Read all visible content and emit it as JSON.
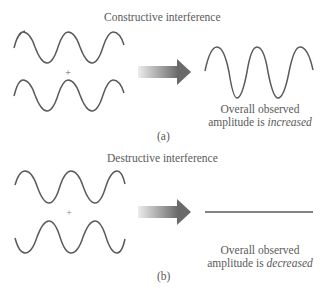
{
  "panels": [
    {
      "id": "a",
      "title": "Constructive interference",
      "plus": "+",
      "result_line1": "Overall observed",
      "result_line2_prefix": "amplitude is ",
      "result_line2_emph": "increased",
      "caption": "(a)"
    },
    {
      "id": "b",
      "title": "Destructive interference",
      "plus": "+",
      "result_line1": "Overall observed",
      "result_line2_prefix": "amplitude is ",
      "result_line2_emph": "decreased",
      "caption": "(b)"
    }
  ],
  "colors": {
    "wave": "#5a5a5a",
    "text": "#5a5a5a",
    "arrow_start": "#e6e6e6",
    "arrow_end": "#6e6e6e"
  }
}
